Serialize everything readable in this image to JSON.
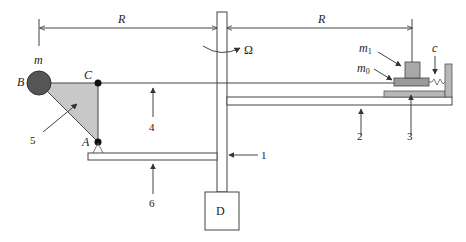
{
  "diagram": {
    "labels": {
      "radius_left": "R",
      "radius_right": "R",
      "omega": "Ω",
      "mass_m": "m",
      "point_b": "B",
      "point_c": "C",
      "point_a": "A",
      "mass_m1": "m",
      "mass_m1_sub": "1",
      "mass_m0": "m",
      "mass_m0_sub": "0",
      "spring_c": "c",
      "motor_d": "D",
      "part_1": "1",
      "part_2": "2",
      "part_3": "3",
      "part_4": "4",
      "part_5": "5",
      "part_6": "6"
    },
    "colors": {
      "ball": "#555555",
      "triangle": "#c8c8c8",
      "block": "#b0b0b0",
      "m0_block": "#9a9a9a",
      "m1_block": "#a8a8a8",
      "line": "#444444"
    }
  }
}
